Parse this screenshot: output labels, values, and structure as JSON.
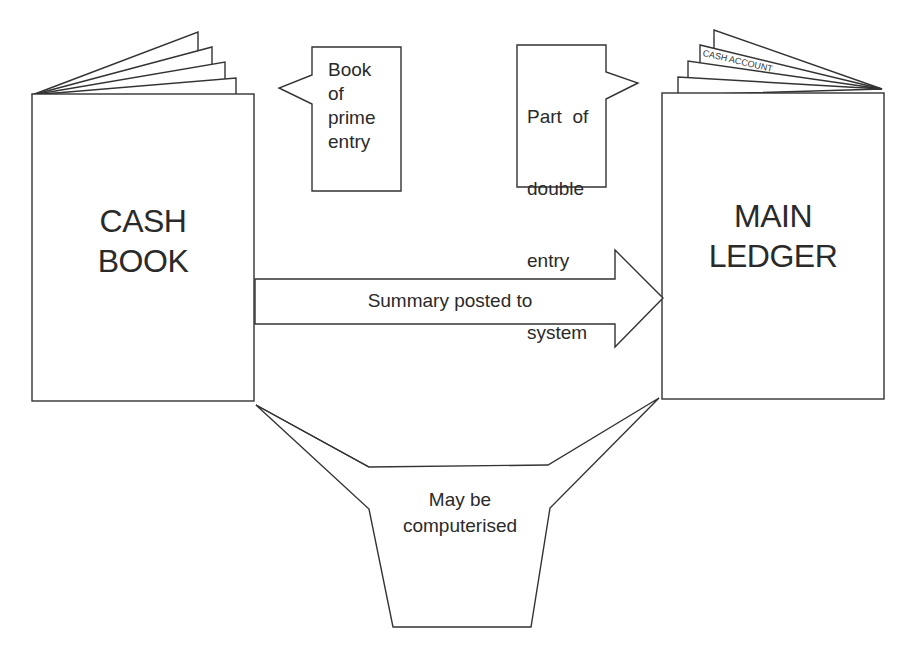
{
  "diagram": {
    "cash_book": {
      "line1": "CASH",
      "line2": "BOOK"
    },
    "main_ledger": {
      "line1": "MAIN",
      "line2": "LEDGER",
      "page_tab": "CASH ACCOUNT"
    },
    "callout_left": {
      "lines": [
        "Book",
        "of",
        "prime",
        "entry"
      ]
    },
    "callout_right": {
      "lines": [
        "Part  of",
        "double",
        "entry",
        "system"
      ]
    },
    "arrow": {
      "label": "Summary posted to"
    },
    "funnel": {
      "line1": "May be",
      "line2": "computerised"
    },
    "colors": {
      "stroke": "#333333",
      "text": "#2a2a2a",
      "background": "#ffffff"
    }
  }
}
